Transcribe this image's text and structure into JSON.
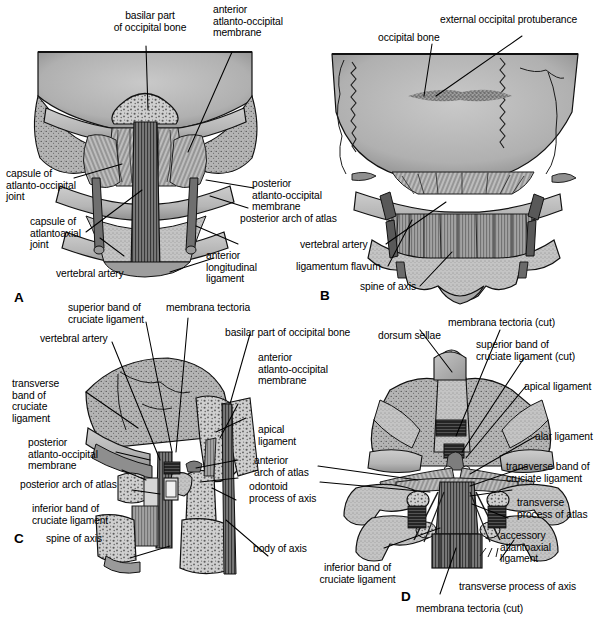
{
  "figure": {
    "panels": [
      {
        "id": "A",
        "letter": "A",
        "view": "anterior view of the atlanto-occipital and atlantoaxial region",
        "labels": [
          "basilar part\nof occipital bone",
          "anterior\natlanto-occipital\nmembrane",
          "capsule of\natlanto-occipital\njoint",
          "capsule of\natlantoaxial\njoint",
          "vertebral artery",
          "posterior\natlanto-occipital\nmembrane",
          "posterior arch of atlas",
          "anterior\nlongitudinal\nligament"
        ]
      },
      {
        "id": "B",
        "letter": "B",
        "view": "posterior view of the occipital bone and upper cervical spine",
        "labels": [
          "occipital bone",
          "external occipital protuberance",
          "vertebral artery",
          "ligamentum flavum",
          "spine of axis"
        ]
      },
      {
        "id": "C",
        "letter": "C",
        "view": "median sagittal section through the craniovertebral junction",
        "labels": [
          "superior band of\ncruciate ligament",
          "membrana tectoria",
          "basilar part of occipital bone",
          "vertebral artery",
          "anterior\natlanto-occipital\nmembrane",
          "transverse\nband of\ncruciate\nligament",
          "apical\nligament",
          "posterior\natlanto-occipital\nmembrane",
          "anterior\narch of atlas",
          "posterior arch of atlas",
          "odontoid\nprocess of axis",
          "inferior band of\ncruciate ligament",
          "spine of axis",
          "body of axis"
        ]
      },
      {
        "id": "D",
        "letter": "D",
        "view": "posterior view with membrana tectoria and cruciate ligament cut",
        "labels": [
          "dorsum sellae",
          "membrana tectoria (cut)",
          "superior band of\ncruciate ligament (cut)",
          "apical ligament",
          "alar ligament",
          "transverse band of\ncruciate ligament",
          "transverse\nprocess of atlas",
          "accessory\natlantoaxial\nligament",
          "transverse process of axis",
          "inferior band of\ncruciate ligament",
          "membrana tectoria (cut)"
        ]
      }
    ]
  },
  "panel_a": {
    "letter": "A",
    "basilar_part": "basilar part\nof occipital bone",
    "anterior_ao_membrane": "anterior\natlanto-occipital\nmembrane",
    "capsule_ao_joint": "capsule of\natlanto-occipital\njoint",
    "capsule_aa_joint": "capsule of\natlantoaxial\njoint",
    "vertebral_artery": "vertebral artery",
    "posterior_ao_membrane": "posterior\natlanto-occipital\nmembrane",
    "posterior_arch_atlas": "posterior arch of atlas",
    "anterior_longitudinal_ligament": "anterior\nlongitudinal\nligament"
  },
  "panel_b": {
    "letter": "B",
    "occipital_bone": "occipital bone",
    "external_occipital_protuberance": "external occipital protuberance",
    "vertebral_artery": "vertebral artery",
    "ligamentum_flavum": "ligamentum flavum",
    "spine_of_axis": "spine of axis"
  },
  "panel_c": {
    "letter": "C",
    "superior_band": "superior band of\ncruciate ligament",
    "membrana_tectoria": "membrana tectoria",
    "basilar_part": "basilar part of occipital bone",
    "vertebral_artery": "vertebral artery",
    "anterior_ao_membrane": "anterior\natlanto-occipital\nmembrane",
    "transverse_band": "transverse\nband of\ncruciate\nligament",
    "apical_ligament": "apical\nligament",
    "posterior_ao_membrane": "posterior\natlanto-occipital\nmembrane",
    "anterior_arch_atlas": "anterior\narch of atlas",
    "posterior_arch_atlas": "posterior arch of atlas",
    "odontoid_process": "odontoid\nprocess of axis",
    "inferior_band": "inferior band of\ncruciate ligament",
    "spine_of_axis": "spine of axis",
    "body_of_axis": "body of axis"
  },
  "panel_d": {
    "letter": "D",
    "dorsum_sellae": "dorsum sellae",
    "membrana_tectoria_cut_top": "membrana tectoria (cut)",
    "superior_band_cut": "superior band of\ncruciate ligament (cut)",
    "apical_ligament": "apical ligament",
    "alar_ligament": "alar ligament",
    "transverse_band": "transverse band of\ncruciate ligament",
    "transverse_process_atlas": "transverse\nprocess of atlas",
    "accessory_ligament": "accessory\natlantoaxial\nligament",
    "transverse_process_axis": "transverse process of axis",
    "inferior_band": "inferior band of\ncruciate ligament",
    "membrana_tectoria_cut_bottom": "membrana tectoria (cut)"
  },
  "style": {
    "background": "#ffffff",
    "ink": "#000000",
    "bone_light": "#c9c9c9",
    "bone_mid": "#a8a8a8",
    "bone_dark": "#8a8a8a",
    "shadow": "#6d6d6d",
    "deep": "#3a3a3a"
  }
}
